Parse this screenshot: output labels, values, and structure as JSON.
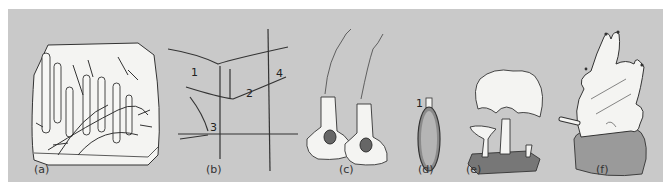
{
  "figure": {
    "panels": [
      {
        "id": "a",
        "caption": "(a)",
        "subject": "branching colonial polyps on substrate block"
      },
      {
        "id": "b",
        "caption": "(b)",
        "subject": "spicule types",
        "labels": [
          "1",
          "2",
          "3",
          "4"
        ]
      },
      {
        "id": "c",
        "caption": "(c)",
        "subject": "flagellated sclerocytes / collar cells"
      },
      {
        "id": "d",
        "caption": "(d)",
        "subject": "gemmule-like capsule",
        "labels": [
          "1"
        ]
      },
      {
        "id": "e",
        "caption": "(e)",
        "subject": "cup-shaped sponge forms on rock"
      },
      {
        "id": "f",
        "caption": "(f)",
        "subject": "lobed sponge with oscula on rock"
      }
    ],
    "colors": {
      "background": "#c9c9c9",
      "fill": "#f4f4f2",
      "ink": "#333333",
      "dark": "#555555"
    }
  }
}
